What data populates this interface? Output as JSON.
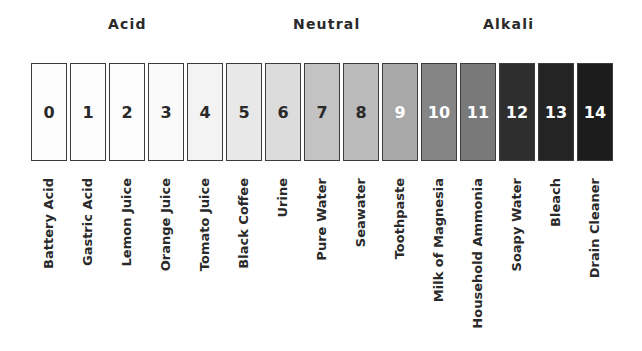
{
  "headers": [
    {
      "label": "Acid",
      "left": 108
    },
    {
      "label": "Neutral",
      "left": 293
    },
    {
      "label": "Alkali",
      "left": 483
    }
  ],
  "chart_data": {
    "type": "table",
    "groups": [
      "Acid",
      "Neutral",
      "Alkali"
    ],
    "items": [
      {
        "ph": "0",
        "label": "Battery Acid",
        "fill": "#fdfdfd",
        "text": "#2a2a2a"
      },
      {
        "ph": "1",
        "label": "Gastric Acid",
        "fill": "#fdfdfd",
        "text": "#2a2a2a"
      },
      {
        "ph": "2",
        "label": "Lemon Juice",
        "fill": "#fcfcfc",
        "text": "#2a2a2a"
      },
      {
        "ph": "3",
        "label": "Orange Juice",
        "fill": "#fafafa",
        "text": "#2a2a2a"
      },
      {
        "ph": "4",
        "label": "Tomato Juice",
        "fill": "#f3f3f3",
        "text": "#2a2a2a"
      },
      {
        "ph": "5",
        "label": "Black Coffee",
        "fill": "#e8e8e8",
        "text": "#2a2a2a"
      },
      {
        "ph": "6",
        "label": "Urine",
        "fill": "#dcdcdc",
        "text": "#2a2a2a"
      },
      {
        "ph": "7",
        "label": "Pure Water",
        "fill": "#c3c3c3",
        "text": "#2a2a2a"
      },
      {
        "ph": "8",
        "label": "Seawater",
        "fill": "#bbbbbb",
        "text": "#2a2a2a"
      },
      {
        "ph": "9",
        "label": "Toothpaste",
        "fill": "#a8a8a8",
        "text": "#ffffff"
      },
      {
        "ph": "10",
        "label": "Milk of Magnesia",
        "fill": "#858585",
        "text": "#ffffff"
      },
      {
        "ph": "11",
        "label": "Household Ammonia",
        "fill": "#797979",
        "text": "#ffffff"
      },
      {
        "ph": "12",
        "label": "Soapy Water",
        "fill": "#2e2e2e",
        "text": "#ffffff"
      },
      {
        "ph": "13",
        "label": "Bleach",
        "fill": "#242424",
        "text": "#ffffff"
      },
      {
        "ph": "14",
        "label": "Drain Cleaner",
        "fill": "#1c1c1c",
        "text": "#ffffff"
      }
    ]
  }
}
